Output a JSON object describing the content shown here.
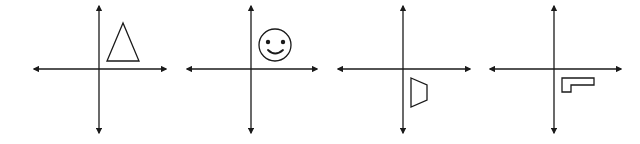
{
  "figure": {
    "width": 640,
    "height": 144,
    "background": "#ffffff",
    "stroke_color": "#1a1a1a",
    "panels": [
      {
        "id": "panel-1",
        "shape": "triangle",
        "quadrant": "I",
        "axes": {
          "cx": 99,
          "cy": 69,
          "x_min": 34,
          "x_max": 166,
          "y_min": 6,
          "y_max": 133
        },
        "points": "123,23 107,61 139,61"
      },
      {
        "id": "panel-2",
        "shape": "smiley-face",
        "quadrant": "I",
        "axes": {
          "cx": 251,
          "cy": 69,
          "x_min": 187,
          "x_max": 317,
          "y_min": 6,
          "y_max": 133
        },
        "circle": {
          "cx": 275,
          "cy": 45,
          "r": 16
        }
      },
      {
        "id": "panel-3",
        "shape": "trapezoid",
        "quadrant": "IV",
        "axes": {
          "cx": 403,
          "cy": 69,
          "x_min": 338,
          "x_max": 470,
          "y_min": 6,
          "y_max": 133
        },
        "points": "411,78 427,85 427,100 411,107"
      },
      {
        "id": "panel-4",
        "shape": "l-shape",
        "quadrant": "IV",
        "axes": {
          "cx": 554,
          "cy": 69,
          "x_min": 490,
          "x_max": 621,
          "y_min": 6,
          "y_max": 133
        },
        "points": "562,78 594,78 594,85 571,85 571,92 562,92"
      }
    ]
  }
}
